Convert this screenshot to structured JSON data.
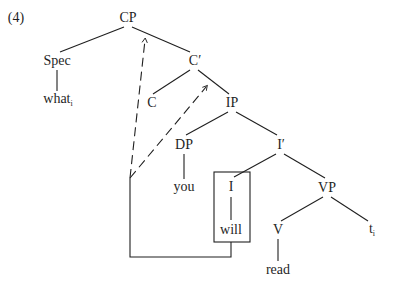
{
  "example_number": "(4)",
  "nodes": {
    "cp": "CP",
    "spec": "Spec",
    "what": "what",
    "what_index": "i",
    "c_bar": "C′",
    "c": "C",
    "ip": "IP",
    "dp": "DP",
    "you": "you",
    "i_bar": "I′",
    "i": "I",
    "will": "will",
    "vp": "VP",
    "v": "V",
    "read": "read",
    "trace": "t",
    "trace_index": "i"
  },
  "colors": {
    "ink": "#1f1f1f",
    "background": "#ffffff"
  }
}
